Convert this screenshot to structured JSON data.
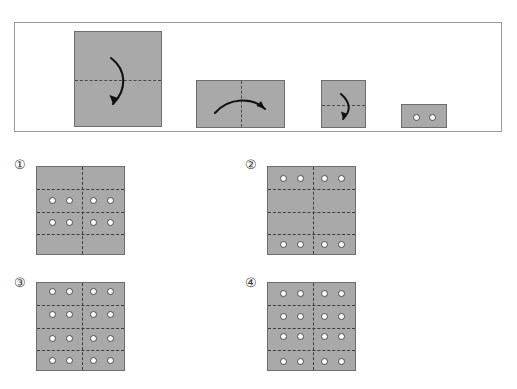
{
  "header": {
    "cut_off_text": ""
  },
  "stimulus": {
    "name": "paper-folding-sequence",
    "steps": [
      {
        "id": "step-1",
        "shape": "square",
        "fold_line": "horizontal",
        "arrow": "fold-down-right",
        "holes": 0
      },
      {
        "id": "step-2",
        "shape": "horizontal-rectangle",
        "fold_line": "vertical",
        "arrow": "fold-right-to-left",
        "holes": 0
      },
      {
        "id": "step-3",
        "shape": "square-small",
        "fold_line": "horizontal",
        "arrow": "fold-down",
        "holes": 0
      },
      {
        "id": "step-4",
        "shape": "horizontal-rectangle-small",
        "fold_line": "none",
        "arrow": "none",
        "holes": 2,
        "hole_positions": [
          [
            0.33,
            0.5
          ],
          [
            0.66,
            0.5
          ]
        ]
      }
    ]
  },
  "options": [
    {
      "id": "option-1",
      "label": "①",
      "h_lines": [
        0.25,
        0.5,
        0.75
      ],
      "v_lines": [
        0.5
      ],
      "hole_rows": [
        0.375,
        0.625
      ],
      "hole_cols": [
        0.17,
        0.37,
        0.63,
        0.83
      ],
      "hole_count": 8
    },
    {
      "id": "option-2",
      "label": "②",
      "h_lines": [
        0.25,
        0.5,
        0.75
      ],
      "v_lines": [
        0.5
      ],
      "hole_rows": [
        0.125,
        0.875
      ],
      "hole_cols": [
        0.17,
        0.37,
        0.63,
        0.83
      ],
      "hole_count": 8
    },
    {
      "id": "option-3",
      "label": "③",
      "h_lines": [
        0.25,
        0.5,
        0.75
      ],
      "v_lines": [
        0.5
      ],
      "hole_rows": [
        0.1,
        0.35,
        0.62,
        0.87
      ],
      "hole_cols": [
        0.17,
        0.37,
        0.63,
        0.83
      ],
      "hole_count": 16
    },
    {
      "id": "option-4",
      "label": "④",
      "h_lines": [
        0.25,
        0.5,
        0.75
      ],
      "v_lines": [
        0.5
      ],
      "hole_rows": [
        0.12,
        0.38,
        0.6,
        0.88
      ],
      "hole_cols": [
        0.17,
        0.37,
        0.63,
        0.83
      ],
      "hole_count": 16
    }
  ],
  "colors": {
    "paper_fill": "#a9a9a9",
    "paper_border": "#6e6e6e",
    "fold_line": "#4a4a4a",
    "hole_fill": "#ffffff",
    "hole_border": "#4c4c4c",
    "box_border": "#9a9a9a",
    "background": "#ffffff",
    "label_text": "#3a3a3a"
  }
}
